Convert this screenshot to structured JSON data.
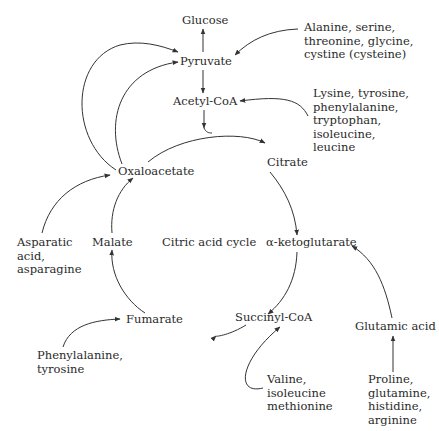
{
  "diagram": {
    "title": "Citric acid cycle",
    "nodes": {
      "glucose": "Glucose",
      "pyruvate": "Pyruvate",
      "acetyl_coa": "Acetyl-CoA",
      "citrate": "Citrate",
      "alpha_ketoglutarate": "α-ketoglutarate",
      "succinyl_coa": "Succinyl-CoA",
      "fumarate": "Fumarate",
      "malate": "Malate",
      "oxaloacetate": "Oxaloacetate",
      "glutamic_acid": "Glutamic acid"
    },
    "sources": {
      "pyruvate_sources": "Alanine, serine,\nthreonine, glycine,\ncystine (cysteine)",
      "acetyl_coa_sources": "Lysine, tyrosine,\nphenylalanine,\ntryptophan,\nisoleucine,\nleucine",
      "oxaloacetate_sources": "Asparatic\nacid,\nasparagine",
      "fumarate_sources": "Phenylalanine,\ntyrosine",
      "succinyl_coa_sources": "Valine,\nisoleucine\nmethionine",
      "glutamic_acid_sources": "Proline,\nglutamine,\nhistidine,\narginine"
    },
    "colors": {
      "line": "#333333",
      "text": "#2a2a2a",
      "background": "#ffffff"
    }
  }
}
